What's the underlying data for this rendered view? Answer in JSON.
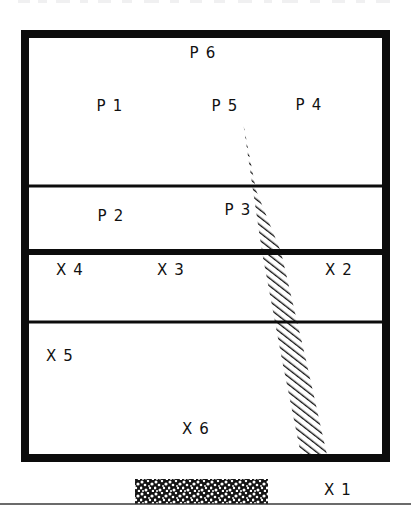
{
  "figure": {
    "name": "geologic-cross-section",
    "background_color": "#ffffff",
    "ink_color": "#0c0c0c",
    "width": 411,
    "height": 515
  },
  "outer_box": {
    "name": "section-frame",
    "x": 21,
    "y": 30,
    "width": 369,
    "height": 432,
    "border_width": 8
  },
  "dividers": [
    {
      "name": "divider-upper",
      "y": 186,
      "thickness": 3,
      "x1": 25,
      "x2": 386
    },
    {
      "name": "divider-middle",
      "y": 252,
      "thickness": 6,
      "x1": 25,
      "x2": 386
    },
    {
      "name": "divider-lower",
      "y": 322,
      "thickness": 3,
      "x1": 25,
      "x2": 386
    }
  ],
  "fault_zone": {
    "name": "hatched-fault-band",
    "pattern": "diagonal-hatch-45",
    "hatch_spacing": 6,
    "hatch_width": 2.6,
    "apex": {
      "x": 243,
      "y": 122
    },
    "left_edge": [
      {
        "x": 243,
        "y": 122
      },
      {
        "x": 262,
        "y": 252
      },
      {
        "x": 282,
        "y": 360
      },
      {
        "x": 301,
        "y": 455
      }
    ],
    "right_edge": [
      {
        "x": 243,
        "y": 122
      },
      {
        "x": 256,
        "y": 190
      },
      {
        "x": 281,
        "y": 252
      },
      {
        "x": 306,
        "y": 360
      },
      {
        "x": 327,
        "y": 455
      }
    ]
  },
  "stipple_block": {
    "name": "stippled-deposit-block",
    "x": 135,
    "y": 479,
    "width": 133,
    "height": 25,
    "pattern": "mottled-stipple"
  },
  "baseline": {
    "name": "ground-rule-line",
    "y": 504,
    "x1": 0,
    "x2": 411
  },
  "labels": [
    {
      "name": "label-p6",
      "text": "P 6",
      "x": 203,
      "y": 53
    },
    {
      "name": "label-p1",
      "text": "P 1",
      "x": 110,
      "y": 106
    },
    {
      "name": "label-p5",
      "text": "P 5",
      "x": 225,
      "y": 106
    },
    {
      "name": "label-p4",
      "text": "P 4",
      "x": 309,
      "y": 105
    },
    {
      "name": "label-p2",
      "text": "P 2",
      "x": 111,
      "y": 216
    },
    {
      "name": "label-p3",
      "text": "P 3",
      "x": 238,
      "y": 210
    },
    {
      "name": "label-x4",
      "text": "X 4",
      "x": 70,
      "y": 270
    },
    {
      "name": "label-x3",
      "text": "X 3",
      "x": 171,
      "y": 270
    },
    {
      "name": "label-x2",
      "text": "X 2",
      "x": 339,
      "y": 270
    },
    {
      "name": "label-x5",
      "text": "X 5",
      "x": 60,
      "y": 356
    },
    {
      "name": "label-x6",
      "text": "X 6",
      "x": 196,
      "y": 429
    },
    {
      "name": "label-x1",
      "text": "X 1",
      "x": 338,
      "y": 490
    }
  ],
  "top_clipped_text": {
    "name": "clipped-caption-remnant",
    "description": "faint cut-off text row at the very top edge"
  }
}
